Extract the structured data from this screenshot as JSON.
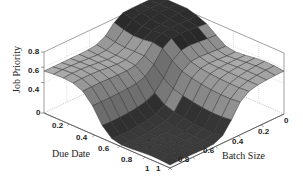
{
  "chart_data": {
    "type": "surface3d",
    "title": "",
    "xlabel": "Due Date",
    "ylabel": "Batch Size",
    "zlabel": "Job Priority",
    "x_ticks": [
      "0",
      "0.2",
      "0.4",
      "0.6",
      "0.8",
      "1"
    ],
    "y_ticks": [
      "0",
      "0.2",
      "0.4",
      "0.6",
      "0.8",
      "1"
    ],
    "z_ticks": [
      "0",
      "0.4",
      "0.6",
      "0.8"
    ],
    "xlim": [
      0,
      1
    ],
    "ylim": [
      0,
      1
    ],
    "zlim": [
      0,
      0.8
    ],
    "grid": true,
    "colormap": "gray",
    "grid_resolution": 13,
    "regions": [
      {
        "name": "high plateau",
        "due_date_range": [
          0.0,
          0.5
        ],
        "batch_size_range": [
          0.0,
          0.45
        ],
        "priority": 0.8
      },
      {
        "name": "mid plateau",
        "due_date_range": [
          0.0,
          1.0
        ],
        "batch_size_range": [
          0.0,
          1.0
        ],
        "priority": 0.55
      },
      {
        "name": "low region",
        "due_date_range": [
          0.45,
          1.0
        ],
        "batch_size_range": [
          0.45,
          1.0
        ],
        "priority": 0.05
      }
    ]
  },
  "labels": {
    "z_axis": "Job Priority",
    "x_axis": "Due Date",
    "y_axis": "Batch Size"
  },
  "ticks": {
    "z": [
      {
        "label": "0.8",
        "x": 28,
        "y": 48
      },
      {
        "label": "0.6",
        "x": 28,
        "y": 67
      },
      {
        "label": "0.4",
        "x": 28,
        "y": 86
      },
      {
        "label": "0",
        "x": 36,
        "y": 109
      }
    ],
    "x": [
      {
        "label": "0.2",
        "x": 52,
        "y": 122
      },
      {
        "label": "0.4",
        "x": 76,
        "y": 134
      },
      {
        "label": "0.6",
        "x": 98,
        "y": 145
      },
      {
        "label": "0.8",
        "x": 121,
        "y": 156
      },
      {
        "label": "1",
        "x": 145,
        "y": 165
      }
    ],
    "y": [
      {
        "label": "1",
        "x": 156,
        "y": 165
      },
      {
        "label": "0.8",
        "x": 178,
        "y": 156
      },
      {
        "label": "0.6",
        "x": 203,
        "y": 147
      },
      {
        "label": "0.4",
        "x": 232,
        "y": 138
      },
      {
        "label": "0.2",
        "x": 258,
        "y": 128
      },
      {
        "label": "0",
        "x": 284,
        "y": 117
      }
    ]
  }
}
